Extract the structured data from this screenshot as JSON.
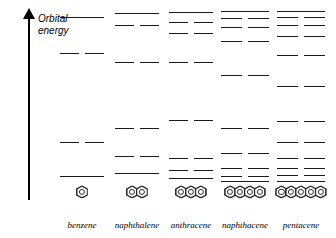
{
  "axis": {
    "label_line1": "Orbital",
    "label_line2": "energy",
    "direction": "up",
    "arrow_icon": "up-arrow-icon"
  },
  "colors": {
    "level_line": "#1a1a1a",
    "axis": "#000000",
    "molecule_outline": "#2a2a2a",
    "background": "#ffffff"
  },
  "chart_data": {
    "type": "line",
    "title": "",
    "subtitle": "",
    "xlabel": "",
    "ylabel": "Orbital energy",
    "grid": false,
    "legend": null,
    "axis_ticks": [],
    "categories": [
      "benzene",
      "naphthalene",
      "anthracene",
      "naphthacene",
      "pentacene"
    ],
    "series": [
      {
        "name": "benzene",
        "rings": 1,
        "n_levels": 4,
        "levels": [
          {
            "y": 17,
            "degeneracy": 1
          },
          {
            "y": 53,
            "degeneracy": 2
          },
          {
            "y": 142,
            "degeneracy": 2
          },
          {
            "y": 176,
            "degeneracy": 1
          }
        ]
      },
      {
        "name": "naphthalene",
        "rings": 2,
        "n_levels": 6,
        "levels": [
          {
            "y": 13,
            "degeneracy": 1
          },
          {
            "y": 25,
            "degeneracy": 2
          },
          {
            "y": 62,
            "degeneracy": 2
          },
          {
            "y": 128,
            "degeneracy": 2
          },
          {
            "y": 156,
            "degeneracy": 2
          },
          {
            "y": 173,
            "degeneracy": 1
          }
        ]
      },
      {
        "name": "anthracene",
        "rings": 3,
        "n_levels": 8,
        "levels": [
          {
            "y": 12,
            "degeneracy": 1
          },
          {
            "y": 22,
            "degeneracy": 2
          },
          {
            "y": 33,
            "degeneracy": 2
          },
          {
            "y": 62,
            "degeneracy": 2
          },
          {
            "y": 120,
            "degeneracy": 2
          },
          {
            "y": 158,
            "degeneracy": 2
          },
          {
            "y": 170,
            "degeneracy": 2
          },
          {
            "y": 178,
            "degeneracy": 1
          }
        ]
      },
      {
        "name": "naphthacene",
        "rings": 4,
        "n_levels": 10,
        "levels": [
          {
            "y": 11,
            "degeneracy": 1
          },
          {
            "y": 18,
            "degeneracy": 2
          },
          {
            "y": 27,
            "degeneracy": 2
          },
          {
            "y": 41,
            "degeneracy": 2
          },
          {
            "y": 75,
            "degeneracy": 2
          },
          {
            "y": 128,
            "degeneracy": 2
          },
          {
            "y": 153,
            "degeneracy": 2
          },
          {
            "y": 168,
            "degeneracy": 2
          },
          {
            "y": 176,
            "degeneracy": 2
          },
          {
            "y": 181,
            "degeneracy": 1
          }
        ]
      },
      {
        "name": "pentacene",
        "rings": 5,
        "n_levels": 12,
        "levels": [
          {
            "y": 11,
            "degeneracy": 1
          },
          {
            "y": 17,
            "degeneracy": 2
          },
          {
            "y": 25,
            "degeneracy": 2
          },
          {
            "y": 36,
            "degeneracy": 2
          },
          {
            "y": 55,
            "degeneracy": 2
          },
          {
            "y": 86,
            "degeneracy": 2
          },
          {
            "y": 121,
            "degeneracy": 2
          },
          {
            "y": 142,
            "degeneracy": 2
          },
          {
            "y": 158,
            "degeneracy": 2
          },
          {
            "y": 168,
            "degeneracy": 2
          },
          {
            "y": 175,
            "degeneracy": 2
          },
          {
            "y": 181,
            "degeneracy": 1
          }
        ]
      }
    ]
  },
  "columns": [
    {
      "label": "benzene",
      "left": 56,
      "width": 52,
      "single_w": 44,
      "pair_w": 19,
      "pair_gap": 6
    },
    {
      "label": "naphthalene",
      "left": 110,
      "width": 54,
      "single_w": 44,
      "pair_w": 19,
      "pair_gap": 6
    },
    {
      "label": "anthracene",
      "left": 164,
      "width": 54,
      "single_w": 44,
      "pair_w": 19,
      "pair_gap": 6
    },
    {
      "label": "naphthacene",
      "left": 216,
      "width": 58,
      "single_w": 48,
      "pair_w": 21,
      "pair_gap": 6
    },
    {
      "label": "pentacene",
      "left": 272,
      "width": 58,
      "single_w": 48,
      "pair_w": 21,
      "pair_gap": 6
    }
  ]
}
